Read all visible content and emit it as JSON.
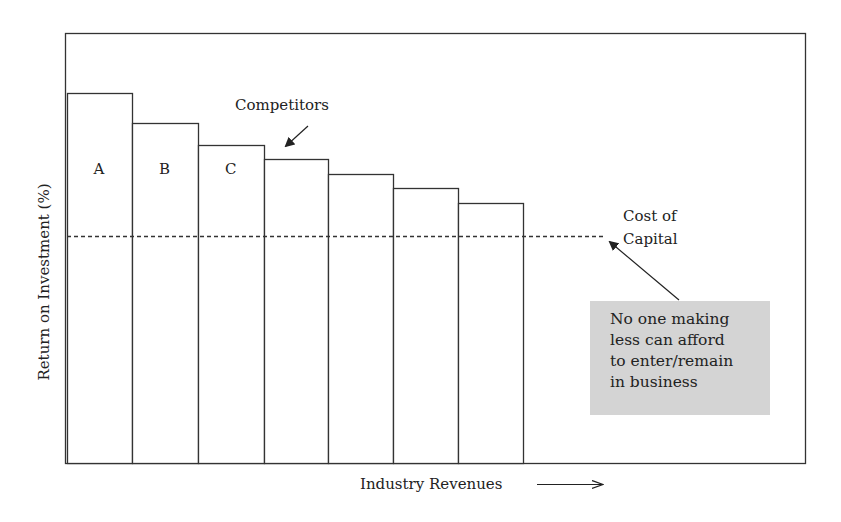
{
  "chart_data": {
    "type": "bar",
    "title": "",
    "xlabel": "Industry Revenues",
    "ylabel": "Return on Investment (%)",
    "categories": [
      "A",
      "B",
      "C",
      "",
      "",
      "",
      ""
    ],
    "values": [
      370,
      340,
      318,
      304,
      289,
      275,
      260
    ],
    "value_units": "relative bar height (px above baseline); no numeric scale shown",
    "reference_line": {
      "label": "Cost of Capital",
      "style": "dashed",
      "value": 227
    },
    "annotations": [
      {
        "text": "Competitors",
        "points_to": "4th bar"
      },
      {
        "text": "Cost of Capital",
        "points_to": "dashed line end"
      },
      {
        "text": "No one making less can afford to enter/remain in business",
        "style": "gray box"
      }
    ],
    "grid": false,
    "legend": null
  },
  "axes": {
    "y_label": "Return on Investment (%)",
    "x_label": "Industry Revenues",
    "x_arrow": "right-arrow-icon"
  },
  "bars": [
    {
      "label": "A",
      "x": 67,
      "w": 65,
      "top": 93
    },
    {
      "label": "B",
      "x": 132,
      "w": 66,
      "top": 123
    },
    {
      "label": "C",
      "x": 198,
      "w": 66,
      "top": 145
    },
    {
      "label": "",
      "x": 264,
      "w": 64,
      "top": 159
    },
    {
      "label": "",
      "x": 328,
      "w": 65,
      "top": 174
    },
    {
      "label": "",
      "x": 393,
      "w": 65,
      "top": 188
    },
    {
      "label": "",
      "x": 458,
      "w": 65,
      "top": 203
    }
  ],
  "annotations": {
    "competitors": "Competitors",
    "cost_of_capital_line1": "Cost of",
    "cost_of_capital_line2": "Capital",
    "note_lines": [
      "No one making",
      "less can afford",
      "to enter/remain",
      "in business"
    ]
  },
  "colors": {
    "line": "#333333",
    "note_bg": "#d4d4d4"
  }
}
